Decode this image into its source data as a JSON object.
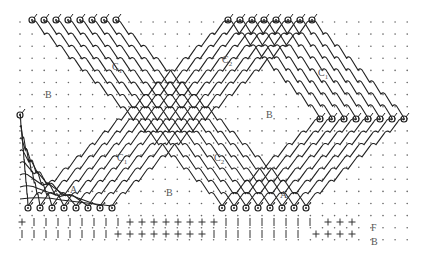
{
  "figure": {
    "colors": {
      "yarn": "#222222",
      "dot": "#666666",
      "label": "#555555",
      "background": "#ffffff"
    },
    "grid": {
      "x_start": 20,
      "x_end": 408,
      "y_start": 22,
      "y_end": 245,
      "step": 12.1
    },
    "labels": [
      {
        "id": "B-left",
        "text": "B",
        "sub": "",
        "x": 45,
        "y": 90
      },
      {
        "id": "C1-left",
        "text": "C",
        "sub": "1",
        "x": 112,
        "y": 62
      },
      {
        "id": "C2-top",
        "text": "C",
        "sub": "2",
        "x": 222,
        "y": 55
      },
      {
        "id": "C1-right",
        "text": "C",
        "sub": "1",
        "x": 318,
        "y": 68
      },
      {
        "id": "B-center",
        "text": "B",
        "sub": "",
        "x": 266,
        "y": 110
      },
      {
        "id": "C1-lower",
        "text": "C",
        "sub": "1",
        "x": 117,
        "y": 153
      },
      {
        "id": "C2-lower",
        "text": "C",
        "sub": "2",
        "x": 214,
        "y": 153
      },
      {
        "id": "A-left",
        "text": "A",
        "sub": "",
        "x": 70,
        "y": 185
      },
      {
        "id": "B-lower",
        "text": "B",
        "sub": "",
        "x": 166,
        "y": 188
      },
      {
        "id": "A-right",
        "text": "A",
        "sub": "",
        "x": 280,
        "y": 190
      },
      {
        "id": "F-label",
        "text": "F",
        "sub": "",
        "x": 371,
        "y": 223
      },
      {
        "id": "B-bottom",
        "text": "B",
        "sub": "",
        "x": 371,
        "y": 237
      }
    ],
    "loop_rows": {
      "top_left": {
        "y": 20,
        "x": [
          32,
          44,
          56,
          68,
          80,
          92,
          104,
          116
        ]
      },
      "top_right": {
        "y": 20,
        "x": [
          228,
          240,
          252,
          264,
          276,
          288,
          300,
          312
        ]
      },
      "right": {
        "y": 119,
        "x": [
          320,
          332,
          344,
          356,
          368,
          380,
          392,
          404
        ]
      },
      "bottom_left": {
        "y": 208,
        "x": [
          28,
          40,
          52,
          64,
          76,
          88,
          100,
          112
        ]
      },
      "bottom_right": {
        "y": 208,
        "x": [
          222,
          234,
          246,
          258,
          270,
          282,
          294,
          306
        ]
      },
      "left_single": {
        "y": 115,
        "x": [
          20
        ]
      }
    },
    "bottom_marks": {
      "row1": {
        "y": 222,
        "plus_x": [
          22,
          130,
          142,
          154,
          166,
          178,
          190,
          202,
          214,
          328,
          340,
          352
        ],
        "bar_x": [
          34,
          46,
          58,
          70,
          82,
          94,
          106,
          118,
          226,
          238,
          250,
          262,
          274,
          286,
          298,
          310
        ]
      },
      "row2": {
        "y": 234,
        "plus_x": [
          118,
          130,
          142,
          154,
          166,
          178,
          190,
          202,
          316,
          328,
          340,
          352
        ],
        "bar_x": [
          22,
          34,
          46,
          58,
          70,
          82,
          94,
          106,
          214,
          226,
          238,
          250,
          262,
          274,
          286,
          298
        ]
      }
    }
  }
}
